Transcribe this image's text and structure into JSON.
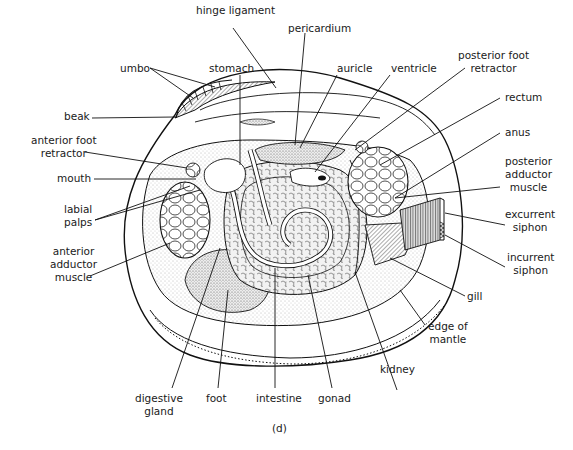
{
  "figure": {
    "caption": "(d)"
  },
  "labels": {
    "hinge_ligament": "hinge ligament",
    "pericardium": "pericardium",
    "umbo": "umbo",
    "stomach": "stomach",
    "auricle": "auricle",
    "ventricle": "ventricle",
    "posterior_foot_retractor_1": "posterior foot",
    "posterior_foot_retractor_2": "retractor",
    "rectum": "rectum",
    "beak": "beak",
    "anus": "anus",
    "anterior_foot_retractor_1": "anterior foot",
    "anterior_foot_retractor_2": "retractor",
    "posterior_adductor_1": "posterior",
    "posterior_adductor_2": "adductor",
    "posterior_adductor_3": "muscle",
    "mouth": "mouth",
    "labial_palps_1": "labial",
    "labial_palps_2": "palps",
    "excurrent_siphon_1": "excurrent",
    "excurrent_siphon_2": "siphon",
    "anterior_adductor_1": "anterior",
    "anterior_adductor_2": "adductor",
    "anterior_adductor_3": "muscle",
    "incurrent_siphon_1": "incurrent",
    "incurrent_siphon_2": "siphon",
    "gill": "gill",
    "edge_of_mantle_1": "edge of",
    "edge_of_mantle_2": "mantle",
    "kidney": "kidney",
    "digestive_gland_1": "digestive",
    "digestive_gland_2": "gland",
    "foot": "foot",
    "intestine": "intestine",
    "gonad": "gonad"
  },
  "colors": {
    "ink": "#111111",
    "stipple": "#d9d9d9",
    "stipple_dark": "#bdbdbd",
    "background": "#ffffff"
  }
}
